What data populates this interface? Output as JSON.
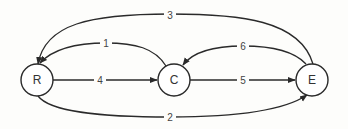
{
  "diagram": {
    "type": "directed-graph",
    "nodes": [
      {
        "id": "R",
        "label": "R",
        "cx": 37,
        "cy": 80,
        "r": 16
      },
      {
        "id": "C",
        "label": "C",
        "cx": 174,
        "cy": 80,
        "r": 16
      },
      {
        "id": "E",
        "label": "E",
        "cx": 312,
        "cy": 80,
        "r": 16
      }
    ],
    "edges": [
      {
        "from": "C",
        "to": "R",
        "label": "1"
      },
      {
        "from": "R",
        "to": "E",
        "label": "2"
      },
      {
        "from": "E",
        "to": "R",
        "label": "3"
      },
      {
        "from": "R",
        "to": "C",
        "label": "4"
      },
      {
        "from": "C",
        "to": "E",
        "label": "5"
      },
      {
        "from": "E",
        "to": "C",
        "label": "6"
      }
    ],
    "colors": {
      "stroke": "#2a2a2a",
      "background": "#fdfdfb"
    }
  }
}
